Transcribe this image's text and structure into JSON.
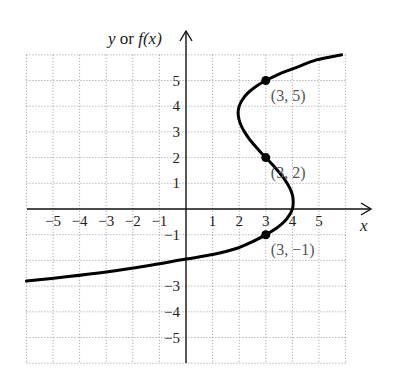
{
  "chart_data": {
    "type": "line",
    "title": "",
    "xlabel": "x",
    "ylabel": "y or f(x)",
    "ylabel_parts": {
      "y": "y",
      "or": " or ",
      "f": "f",
      "x": "(x)"
    },
    "xlim": [
      -6,
      6
    ],
    "ylim": [
      -6,
      6
    ],
    "grid": true,
    "grid_style": "dotted",
    "x_ticks": [
      -5,
      -4,
      -3,
      -2,
      -1,
      1,
      2,
      3,
      4,
      5
    ],
    "x_tick_labels": [
      "−5",
      "−4",
      "−3",
      "−2",
      "−1",
      "1",
      "2",
      "3",
      "4",
      "5"
    ],
    "y_ticks": [
      5,
      4,
      3,
      2,
      1,
      -1,
      -3,
      -4,
      -5
    ],
    "y_tick_labels": [
      "5",
      "4",
      "3",
      "2",
      "1",
      "−1",
      "−3",
      "−4",
      "−5"
    ],
    "series": [
      {
        "name": "curve",
        "color": "#000000",
        "x": [
          5.85,
          4.9,
          4.14,
          3.5,
          3.0,
          2.6,
          2.31,
          2.12,
          2.0,
          1.96,
          1.99,
          2.07,
          2.2,
          2.36,
          2.56,
          2.77,
          3.0,
          3.23,
          3.44,
          3.64,
          3.8,
          3.93,
          4.01,
          4.03,
          4.0,
          3.88,
          3.69,
          3.4,
          3.0,
          2.5,
          1.86,
          1.0,
          0.0,
          -1.5,
          -3.0,
          -4.5,
          -6.0
        ],
        "y": [
          6.0,
          5.8,
          5.5,
          5.25,
          5.0,
          4.75,
          4.5,
          4.25,
          4.0,
          3.75,
          3.5,
          3.25,
          3.0,
          2.75,
          2.5,
          2.25,
          2.0,
          1.75,
          1.5,
          1.25,
          1.0,
          0.75,
          0.5,
          0.25,
          0.0,
          -0.25,
          -0.5,
          -0.75,
          -1.0,
          -1.27,
          -1.55,
          -1.77,
          -1.95,
          -2.22,
          -2.45,
          -2.64,
          -2.8
        ]
      }
    ],
    "points": [
      {
        "x": 3,
        "y": 5,
        "label_open": "(",
        "label_num1": "3",
        "label_rest": ", 5)"
      },
      {
        "x": 3,
        "y": 2,
        "label_open": "(",
        "label_num1": "3",
        "label_rest": ", 2)"
      },
      {
        "x": 3,
        "y": -1,
        "label_open": "(",
        "label_num1": "3",
        "label_rest": ", −1)"
      }
    ],
    "point_labels": [
      "(3, 5)",
      "(3, 2)",
      "(3, −1)"
    ],
    "annotation_color": "#555555"
  }
}
